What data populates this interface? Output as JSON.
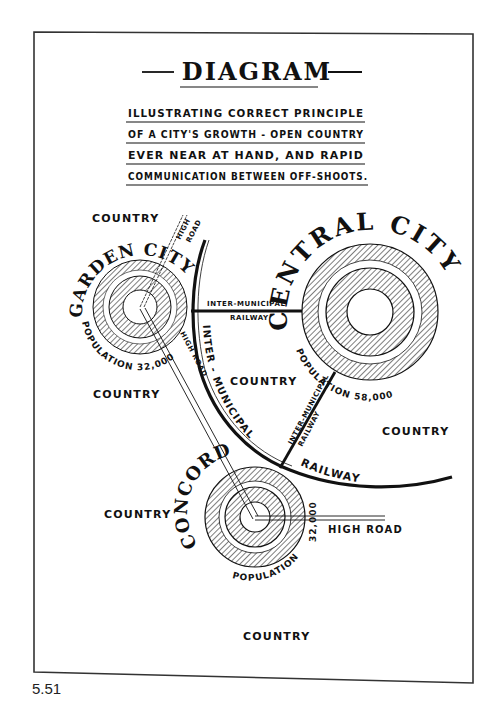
{
  "figure_number": "5.51",
  "header": {
    "title": "DIAGRAM",
    "dash_left": "—",
    "dash_right": "—",
    "subtitle_lines": [
      "ILLUSTRATING CORRECT PRINCIPLE",
      "OF A CITY'S GROWTH - OPEN COUNTRY",
      "EVER NEAR AT HAND, AND RAPID",
      "COMMUNICATION BETWEEN OFF-SHOOTS."
    ]
  },
  "cities": {
    "garden": {
      "name": "GARDEN CITY",
      "population_label": "POPULATION 32,000"
    },
    "central": {
      "name": "CENTRAL CITY",
      "population_label": "POPULATION 58,000"
    },
    "concord": {
      "name": "CONCORD",
      "population_word": "POPULATION",
      "population_value": "32,000"
    }
  },
  "routes": {
    "high_road_top": "HIGH ROAD",
    "high_road_top_1": "HIGH",
    "high_road_top_2": "ROAD",
    "high_road_diag": "HIGH ROAD",
    "high_road_right": "HIGH ROAD",
    "rail_horizontal_1": "INTER-MUNICIPAL",
    "rail_horizontal_2": "RAILWAY",
    "rail_arc_1": "INTER - MUNICIPAL",
    "rail_arc_2": "RAILWAY",
    "rail_diag_1": "INTER-MUNICIPAL",
    "rail_diag_2": "RAILWAY"
  },
  "country_labels": {
    "top_left": "COUNTRY",
    "left_mid": "COUNTRY",
    "center": "COUNTRY",
    "right": "COUNTRY",
    "left_lower": "COUNTRY",
    "bottom": "COUNTRY"
  },
  "colors": {
    "ink": "#111111",
    "paper": "#ffffff",
    "frame": "#333333"
  }
}
